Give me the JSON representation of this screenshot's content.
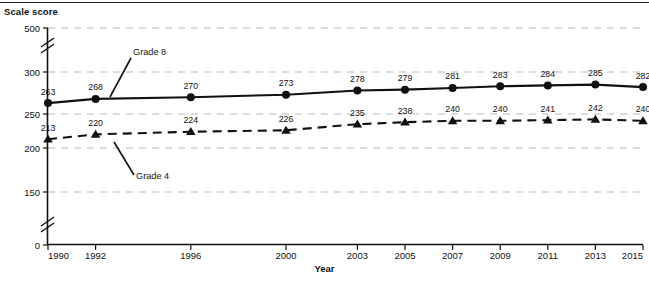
{
  "figure": {
    "y_axis_title": "Scale score",
    "x_axis_title": "Year"
  },
  "chart_data": {
    "type": "line",
    "title": "",
    "xlabel": "Year",
    "ylabel": "Scale score",
    "x": [
      1990,
      1992,
      1996,
      2000,
      2003,
      2005,
      2007,
      2009,
      2011,
      2013,
      2015
    ],
    "categories": [
      "1990",
      "1992",
      "1996",
      "2000",
      "2003",
      "2005",
      "2007",
      "2009",
      "2011",
      "2013",
      "2015"
    ],
    "ylim": [
      0,
      500
    ],
    "ytick_labels": [
      "500",
      "300",
      "250",
      "200",
      "150",
      "0"
    ],
    "yticks": [
      500,
      300,
      250,
      200,
      150,
      0
    ],
    "grid": true,
    "axis_breaks": [
      "between 300 and 500",
      "between 0 and 150"
    ],
    "legend": "inline annotations",
    "series": [
      {
        "name": "Grade 8",
        "marker": "circle",
        "linestyle": "solid",
        "color": "#111111",
        "values": [
          263,
          268,
          270,
          273,
          278,
          279,
          281,
          283,
          284,
          285,
          282
        ],
        "labels": [
          "263",
          "268",
          "270",
          "273",
          "278",
          "279",
          "281",
          "283",
          "284",
          "285",
          "282"
        ]
      },
      {
        "name": "Grade 4",
        "marker": "triangle",
        "linestyle": "dashed",
        "color": "#111111",
        "values": [
          213,
          220,
          224,
          226,
          235,
          238,
          240,
          240,
          241,
          242,
          240
        ],
        "labels": [
          "213",
          "220",
          "224",
          "226",
          "235",
          "238",
          "240",
          "240",
          "241",
          "242",
          "240"
        ]
      }
    ],
    "annotations": [
      {
        "text": "Grade 8",
        "for_series": "Grade 8"
      },
      {
        "text": "Grade 4",
        "for_series": "Grade 4"
      }
    ]
  }
}
